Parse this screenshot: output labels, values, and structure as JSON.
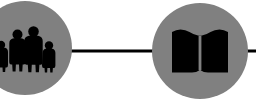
{
  "diagram": {
    "title": "Community and Education Link Diagram",
    "background_color": "#ffffff",
    "node_fill_color": "#808080",
    "glyph_color": "#000000",
    "connector_color": "#000000",
    "nodes": [
      {
        "id": "people-node",
        "label": "People group node",
        "icon": "people-group-icon",
        "icon_description": "Silhouettes of four standing figures: two children and two adults",
        "shape": "circle",
        "center_x": 25,
        "center_y": 48,
        "radius": 47,
        "fill": "#808080",
        "cropped": "left edge"
      },
      {
        "id": "book-node",
        "label": "Open book node",
        "icon": "open-book-icon",
        "icon_description": "Solid silhouette of an open book with two facing pages",
        "shape": "circle",
        "center_x": 200,
        "center_y": 51,
        "radius": 48,
        "fill": "#808080",
        "cropped": "none"
      }
    ],
    "connectors": [
      {
        "id": "connector-people-to-book",
        "label": "Link between people node and book node",
        "from": "people-node",
        "to": "book-node",
        "x1": 66,
        "x2": 155,
        "y": 51,
        "thickness": 3,
        "color": "#000000"
      },
      {
        "id": "connector-book-to-right",
        "label": "Link leaving book node toward the right edge",
        "from": "book-node",
        "to": "offscreen-right",
        "x1": 244,
        "x2": 256,
        "y": 51,
        "thickness": 3,
        "color": "#000000"
      }
    ],
    "figures": [
      {
        "id": "figure-child-left",
        "role": "child",
        "x": 2,
        "height": 30
      },
      {
        "id": "figure-adult-left",
        "role": "adult",
        "x": 12,
        "height": 40
      },
      {
        "id": "figure-adult-tall",
        "role": "adult",
        "x": 27,
        "height": 46
      },
      {
        "id": "figure-child-right",
        "role": "child",
        "x": 42,
        "height": 30
      }
    ]
  }
}
